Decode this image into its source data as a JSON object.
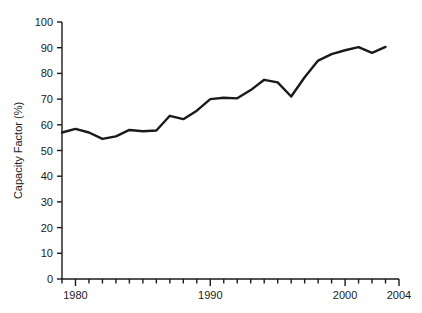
{
  "chart_data": {
    "type": "line",
    "title": "",
    "xlabel": "",
    "ylabel": "Capacity Factor (%)",
    "xlim": [
      1979,
      2004
    ],
    "ylim": [
      0,
      100
    ],
    "grid": false,
    "legend": "none",
    "y_ticks": [
      0,
      10,
      20,
      30,
      40,
      50,
      60,
      70,
      80,
      90,
      100
    ],
    "y_tick_labels": [
      "0",
      "10",
      "20",
      "30",
      "40",
      "50",
      "60",
      "70",
      "80",
      "90",
      "100"
    ],
    "x_ticks": [
      1979,
      1980,
      1981,
      1982,
      1983,
      1984,
      1985,
      1986,
      1987,
      1988,
      1989,
      1990,
      1991,
      1992,
      1993,
      1994,
      1995,
      1996,
      1997,
      1998,
      1999,
      2000,
      2001,
      2002,
      2003,
      2004
    ],
    "x_tick_labels_shown": [
      "1980",
      "1990",
      "2000",
      "2004"
    ],
    "x_labeled_ticks": [
      1980,
      1990,
      2000,
      2004
    ],
    "x": [
      1979,
      1980,
      1981,
      1982,
      1983,
      1984,
      1985,
      1986,
      1987,
      1988,
      1989,
      1990,
      1991,
      1992,
      1993,
      1994,
      1995,
      1996,
      1997,
      1998,
      1999,
      2000,
      2001,
      2002,
      2003
    ],
    "values": [
      57.0,
      58.4,
      57.0,
      54.5,
      55.5,
      58.0,
      57.5,
      57.8,
      63.5,
      62.2,
      65.5,
      70.0,
      70.5,
      70.3,
      73.5,
      77.5,
      76.5,
      71.0,
      78.5,
      85.0,
      87.5,
      89.0,
      90.2,
      88.0,
      90.3
    ],
    "series": [
      {
        "name": "Capacity Factor",
        "values": [
          57.0,
          58.4,
          57.0,
          54.5,
          55.5,
          58.0,
          57.5,
          57.8,
          63.5,
          62.2,
          65.5,
          70.0,
          70.5,
          70.3,
          73.5,
          77.5,
          76.5,
          71.0,
          78.5,
          85.0,
          87.5,
          89.0,
          90.2,
          88.0,
          90.3
        ],
        "color": "#1a1a1a"
      }
    ],
    "line_color": "#1a1a1a",
    "line_width": 2.4,
    "axis_color": "#1a1a1a",
    "background": "#ffffff"
  },
  "axes": {
    "y_label_text": "Capacity Factor (%)",
    "x_label_text": ""
  }
}
